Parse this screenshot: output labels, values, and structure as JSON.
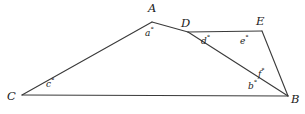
{
  "figure": {
    "background_color": "#ffffff",
    "stroke_color": "#3a3a3a",
    "label_color": "#1a1a1a",
    "stroke_width": 1.1,
    "width": 305,
    "height": 114
  },
  "vertices": [
    {
      "id": "A",
      "label": "A",
      "x": 152,
      "y": 22,
      "label_x": 148,
      "label_y": 3
    },
    {
      "id": "D",
      "label": "D",
      "x": 188,
      "y": 32,
      "label_x": 181,
      "label_y": 18
    },
    {
      "id": "E",
      "label": "E",
      "x": 262,
      "y": 31,
      "label_x": 256,
      "label_y": 16
    },
    {
      "id": "B",
      "label": "B",
      "x": 288,
      "y": 96,
      "label_x": 291,
      "label_y": 94
    },
    {
      "id": "C",
      "label": "C",
      "x": 22,
      "y": 95,
      "label_x": 7,
      "label_y": 91
    }
  ],
  "segments": [
    {
      "id": "CA",
      "from": "C",
      "to": "A",
      "x1": 22,
      "y1": 95,
      "x2": 152,
      "y2": 22
    },
    {
      "id": "AD",
      "from": "A",
      "to": "D",
      "x1": 152,
      "y1": 22,
      "x2": 188,
      "y2": 32
    },
    {
      "id": "DE",
      "from": "D",
      "to": "E",
      "x1": 188,
      "y1": 32,
      "x2": 262,
      "y2": 31
    },
    {
      "id": "DB",
      "from": "D",
      "to": "B",
      "x1": 188,
      "y1": 32,
      "x2": 288,
      "y2": 96
    },
    {
      "id": "EB",
      "from": "E",
      "to": "B",
      "x1": 262,
      "y1": 31,
      "x2": 288,
      "y2": 96
    },
    {
      "id": "CB",
      "from": "C",
      "to": "B",
      "x1": 22,
      "y1": 95,
      "x2": 288,
      "y2": 96
    }
  ],
  "angles": [
    {
      "id": "a",
      "letter": "a",
      "degree": "°",
      "at_vertex": "A",
      "x": 145,
      "y": 29
    },
    {
      "id": "d",
      "letter": "d",
      "degree": "°",
      "at_vertex": "D",
      "x": 201,
      "y": 37
    },
    {
      "id": "e",
      "letter": "e",
      "degree": "°",
      "at_vertex": "E",
      "x": 240,
      "y": 37
    },
    {
      "id": "f",
      "letter": "f",
      "degree": "°",
      "at_vertex": "B",
      "x": 258,
      "y": 70
    },
    {
      "id": "b",
      "letter": "b",
      "degree": "°",
      "at_vertex": "B",
      "x": 248,
      "y": 82
    },
    {
      "id": "c",
      "letter": "c",
      "degree": "°",
      "at_vertex": "C",
      "x": 46,
      "y": 80
    }
  ]
}
